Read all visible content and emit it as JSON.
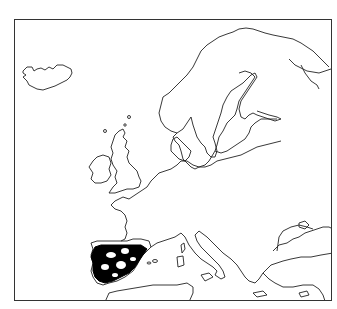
{
  "map": {
    "region": "Europe",
    "style": "black-and-white outline map",
    "distribution": {
      "area": "Iberian Peninsula",
      "fill_color": "#000000"
    },
    "frame_color": "#333333",
    "coastline_color": "#222222",
    "landmasses": [
      "Iceland",
      "Scandinavia",
      "British Isles",
      "Continental Europe",
      "Italy",
      "Balkans",
      "Black Sea coast",
      "North Africa",
      "Mediterranean islands"
    ]
  }
}
